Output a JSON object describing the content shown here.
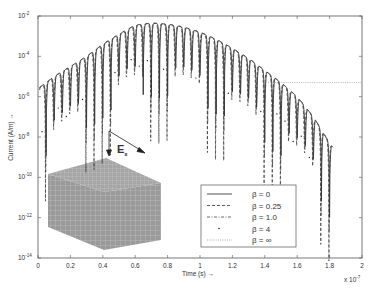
{
  "chart_data": {
    "type": "line",
    "title": "",
    "xlabel": "Time (s) →",
    "ylabel": "Current (A/m) →",
    "x_multiplier_label": "x 10",
    "x_multiplier_exp": "-7",
    "xlim": [
      0,
      2
    ],
    "ylim_log10": [
      -14,
      -2
    ],
    "yscale": "log",
    "grid": false,
    "x_ticks": [
      "0",
      "0.2",
      "0.4",
      "0.6",
      "0.8",
      "1",
      "1.2",
      "1.4",
      "1.6",
      "1.8",
      "2"
    ],
    "y_ticks": [
      {
        "base": "10",
        "exp": "-2"
      },
      {
        "base": "10",
        "exp": "-4"
      },
      {
        "base": "10",
        "exp": "-6"
      },
      {
        "base": "10",
        "exp": "-8"
      },
      {
        "base": "10",
        "exp": "-10"
      },
      {
        "base": "10",
        "exp": "-12"
      },
      {
        "base": "10",
        "exp": "-14"
      }
    ],
    "legend_position": "lower right",
    "series": [
      {
        "name": "β = 0",
        "style": "solid"
      },
      {
        "name": "β = 0.25",
        "style": "dashed"
      },
      {
        "name": "β = 1.0",
        "style": "dashdot"
      },
      {
        "name": "β = 4",
        "style": "point"
      },
      {
        "name": "β = ∞",
        "style": "dotted"
      }
    ],
    "envelope_log10_peak": {
      "t": [
        0.0,
        0.1,
        0.2,
        0.3,
        0.4,
        0.5,
        0.6,
        0.7,
        0.8,
        0.9,
        1.0,
        1.1,
        1.2,
        1.3,
        1.4,
        1.5,
        1.6,
        1.7,
        1.8,
        1.82
      ],
      "log10_I": [
        -5.6,
        -5.0,
        -4.5,
        -4.0,
        -3.4,
        -2.9,
        -2.45,
        -2.35,
        -2.4,
        -2.55,
        -2.8,
        -3.15,
        -3.6,
        -4.1,
        -4.7,
        -5.3,
        -6.0,
        -7.0,
        -8.3,
        -8.5
      ]
    },
    "oscillation_period": 0.05,
    "beta_inf_level_log10": -5.3,
    "beta_inf_start_t": 1.42,
    "annotations": [
      {
        "text": "E",
        "subscript": "x",
        "desc": "incident field arrow over cube"
      }
    ]
  },
  "inset": {
    "label_main": "E",
    "label_sub": "x"
  }
}
